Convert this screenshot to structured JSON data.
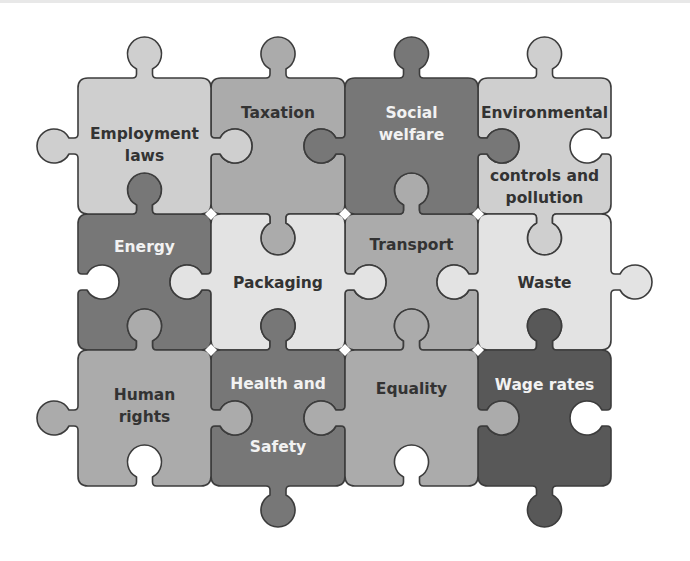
{
  "diagram": {
    "type": "jigsaw-puzzle",
    "grid": {
      "rows": 3,
      "columns": 4
    },
    "colors": {
      "very_light": "#e3e3e3",
      "light": "#cfcfcf",
      "mid": "#ababab",
      "dark": "#777777",
      "darkest": "#585858",
      "outline": "#3c3c3c",
      "text_dark": "#333333",
      "text_light": "#f2f2f2"
    },
    "pieces": [
      {
        "id": "employment-laws",
        "row": 0,
        "col": 0,
        "lines": [
          "Employment",
          "laws"
        ],
        "shade": "light"
      },
      {
        "id": "taxation",
        "row": 0,
        "col": 1,
        "lines": [
          "Taxation"
        ],
        "shade": "mid"
      },
      {
        "id": "social-welfare",
        "row": 0,
        "col": 2,
        "lines": [
          "Social",
          "welfare"
        ],
        "shade": "dark"
      },
      {
        "id": "environmental-controls",
        "row": 0,
        "col": 3,
        "lines": [
          "Environmental",
          "controls and",
          "pollution"
        ],
        "shade": "light"
      },
      {
        "id": "energy",
        "row": 1,
        "col": 0,
        "lines": [
          "Energy"
        ],
        "shade": "dark"
      },
      {
        "id": "packaging",
        "row": 1,
        "col": 1,
        "lines": [
          "Packaging"
        ],
        "shade": "very_light"
      },
      {
        "id": "transport",
        "row": 1,
        "col": 2,
        "lines": [
          "Transport"
        ],
        "shade": "mid"
      },
      {
        "id": "waste",
        "row": 1,
        "col": 3,
        "lines": [
          "Waste"
        ],
        "shade": "very_light"
      },
      {
        "id": "human-rights",
        "row": 2,
        "col": 0,
        "lines": [
          "Human",
          "rights"
        ],
        "shade": "mid"
      },
      {
        "id": "health-and-safety",
        "row": 2,
        "col": 1,
        "lines": [
          "Health and",
          "Safety"
        ],
        "shade": "dark"
      },
      {
        "id": "equality",
        "row": 2,
        "col": 2,
        "lines": [
          "Equality"
        ],
        "shade": "mid"
      },
      {
        "id": "wage-rates",
        "row": 2,
        "col": 3,
        "lines": [
          "Wage rates"
        ],
        "shade": "darkest"
      }
    ]
  }
}
